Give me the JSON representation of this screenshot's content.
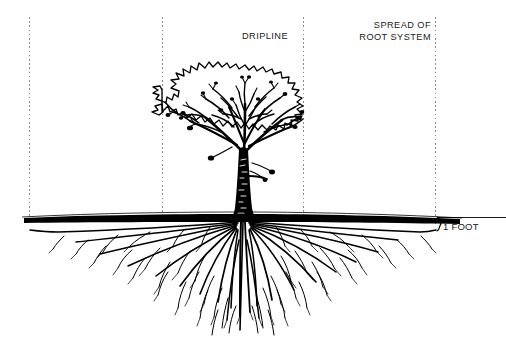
{
  "diagram": {
    "ground_line_label": "soil surface",
    "ink_color": "#000000",
    "background_color": "#ffffff",
    "guide_color": "#8c8c8c"
  },
  "labels": {
    "dripline": "DRIPLINE",
    "spread_line1": "SPREAD OF",
    "spread_line2": "ROOT SYSTEM",
    "depth": "1 FOOT"
  },
  "guides": {
    "dashed_lines": [
      {
        "name": "root-spread-left",
        "x": 29,
        "y_top": 17,
        "y_bottom": 221
      },
      {
        "name": "dripline-left",
        "x": 162,
        "y_top": 17,
        "y_bottom": 221
      },
      {
        "name": "dripline-right",
        "x": 303,
        "y_top": 17,
        "y_bottom": 221
      },
      {
        "name": "root-spread-right",
        "x": 435,
        "y_top": 17,
        "y_bottom": 226
      }
    ]
  },
  "measures": {
    "depth_brace": {
      "name": "one-foot-brace",
      "x": 438,
      "y_top": 217,
      "y_bottom": 231
    },
    "depth_rule": {
      "x_start": 437,
      "x_end": 506,
      "y": 217
    }
  },
  "tree": {
    "canopy_left_x": 162,
    "canopy_right_x": 303,
    "canopy_top_y": 62,
    "trunk_center_x": 243,
    "ground_y": 220,
    "root_depth_y": 330,
    "root_left_x": 29,
    "root_right_x": 435
  }
}
